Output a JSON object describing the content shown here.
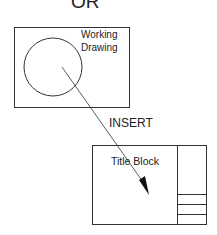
{
  "header": {
    "text": "OR"
  },
  "working_drawing": {
    "label_line1": "Working",
    "label_line2": "Drawing"
  },
  "arrow": {
    "label": "INSERT"
  },
  "title_block": {
    "label": "Title Block",
    "rows": 3
  },
  "colors": {
    "stroke": "#333333",
    "background": "#ffffff"
  }
}
